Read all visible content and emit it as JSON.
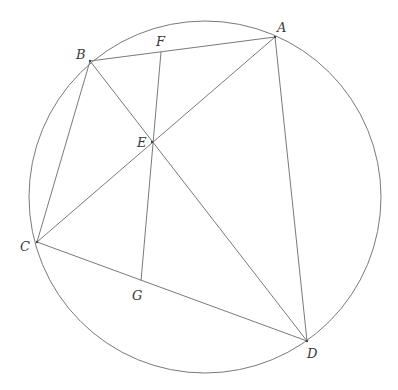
{
  "diagram": {
    "title": "",
    "circle": {
      "cx": 205,
      "cy": 197,
      "r": 176
    },
    "points": {
      "A": {
        "x": 275,
        "y": 37
      },
      "B": {
        "x": 90,
        "y": 61
      },
      "C": {
        "x": 37,
        "y": 242
      },
      "D": {
        "x": 307,
        "y": 341
      },
      "E": {
        "x": 152,
        "y": 142
      },
      "F": {
        "x": 161,
        "y": 52
      },
      "G": {
        "x": 141,
        "y": 281
      }
    },
    "labels": {
      "A": "A",
      "B": "B",
      "C": "C",
      "D": "D",
      "E": "E",
      "F": "F",
      "G": "G"
    },
    "segments": [
      [
        "A",
        "B"
      ],
      [
        "B",
        "C"
      ],
      [
        "C",
        "D"
      ],
      [
        "D",
        "A"
      ],
      [
        "A",
        "C"
      ],
      [
        "B",
        "D"
      ],
      [
        "F",
        "G"
      ]
    ],
    "colors": {
      "line": "#7a7a7a",
      "label": "#3a3a3a"
    }
  }
}
